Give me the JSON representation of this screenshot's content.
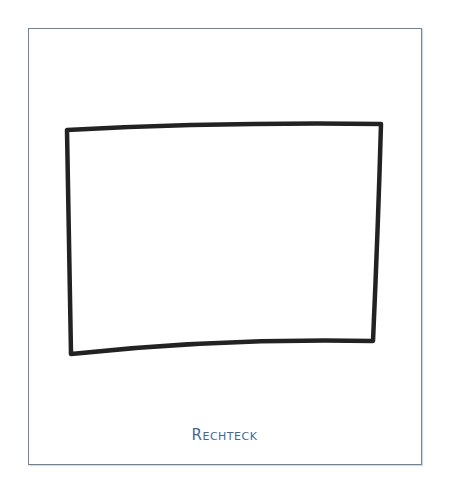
{
  "figure": {
    "caption": "Rechteck",
    "colors": {
      "frame_border": "#6f8296",
      "caption": "#3f6a93",
      "stroke": "#222222"
    },
    "shape": {
      "type": "hand-drawn rectangle",
      "corners": {
        "top_left": [
          67,
          130
        ],
        "top_right": [
          381,
          124
        ],
        "bottom_right": [
          373,
          341
        ],
        "bottom_left": [
          71,
          354
        ]
      }
    }
  }
}
